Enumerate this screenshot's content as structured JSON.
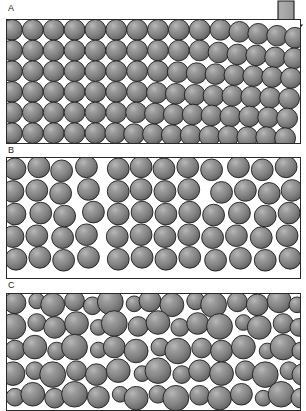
{
  "figure": {
    "background_color": "#ffffff",
    "width": 306,
    "height": 410,
    "sphere_fill": "#808080",
    "sphere_highlight": "#b4b4b4",
    "sphere_shadow": "#5a5a5a",
    "sphere_stroke": "#1c1c1c",
    "panel_border_color": "#2a2a2a",
    "void_color": "#ffffff"
  },
  "panels": [
    {
      "id": "a",
      "label": "A",
      "caption": "Ordered close packing with applied compaction",
      "packing_type": "ordered-cubic-to-hexagonal",
      "sphere_size": "monodisperse",
      "sphere_diameter_px": 21,
      "porosity_description": "regular interstitial voids",
      "has_compaction_arrow": true
    },
    {
      "id": "b",
      "label": "B",
      "caption": "Loose random packing with large voids",
      "packing_type": "loose-random",
      "sphere_size": "monodisperse",
      "sphere_diameter_px": 22,
      "porosity_description": "large irregular voids",
      "has_compaction_arrow": false
    },
    {
      "id": "c",
      "label": "C",
      "caption": "Dense polydisperse packing",
      "packing_type": "dense-polydisperse",
      "sphere_size": "polydisperse",
      "sphere_diameter_px": "8-24",
      "porosity_description": "minimal void space",
      "has_compaction_arrow": false
    }
  ],
  "arrow": {
    "name": "compaction-arrow",
    "direction": "down",
    "label": "",
    "fill": "#9a9a9a",
    "stroke": "#1c1c1c"
  },
  "chart_data": {
    "type": "scatter",
    "xlabel": "",
    "ylabel": "",
    "panel_a_spheres": [
      [
        11,
        29,
        10.5
      ],
      [
        32,
        29,
        10.5
      ],
      [
        53,
        29,
        10.5
      ],
      [
        74,
        29,
        10.5
      ],
      [
        95,
        29,
        10.5
      ],
      [
        116,
        29,
        10.5
      ],
      [
        137,
        29,
        10.5
      ],
      [
        158,
        29,
        10.5
      ],
      [
        179,
        29,
        10.5
      ],
      [
        200,
        29,
        10.5
      ],
      [
        221,
        29,
        10.5
      ],
      [
        240,
        31,
        10.5
      ],
      [
        259,
        33,
        10.5
      ],
      [
        278,
        35,
        10.5
      ],
      [
        296,
        37,
        10.5
      ],
      [
        11,
        50,
        10.5
      ],
      [
        32,
        50,
        10.5
      ],
      [
        53,
        50,
        10.5
      ],
      [
        74,
        50,
        10.5
      ],
      [
        95,
        50,
        10.5
      ],
      [
        116,
        50,
        10.5
      ],
      [
        137,
        50,
        10.5
      ],
      [
        158,
        50,
        10.5
      ],
      [
        179,
        50,
        10.5
      ],
      [
        200,
        50,
        10.5
      ],
      [
        219,
        52,
        10.5
      ],
      [
        238,
        54,
        10.5
      ],
      [
        257,
        55,
        10.5
      ],
      [
        276,
        57,
        10.5
      ],
      [
        295,
        58,
        10.5
      ],
      [
        11,
        71,
        10.5
      ],
      [
        32,
        71,
        10.5
      ],
      [
        53,
        71,
        10.5
      ],
      [
        74,
        71,
        10.5
      ],
      [
        95,
        71,
        10.5
      ],
      [
        116,
        71,
        10.5
      ],
      [
        137,
        71,
        10.5
      ],
      [
        158,
        71,
        10.5
      ],
      [
        178,
        72,
        10.5
      ],
      [
        197,
        73,
        10.5
      ],
      [
        216,
        74,
        10.5
      ],
      [
        235,
        75,
        10.5
      ],
      [
        254,
        76,
        10.5
      ],
      [
        273,
        77,
        10.5
      ],
      [
        292,
        78,
        10.5
      ],
      [
        11,
        92,
        10.5
      ],
      [
        32,
        92,
        10.5
      ],
      [
        53,
        92,
        10.5
      ],
      [
        74,
        92,
        10.5
      ],
      [
        95,
        92,
        10.5
      ],
      [
        116,
        92,
        10.5
      ],
      [
        137,
        92,
        10.5
      ],
      [
        157,
        93,
        10.5
      ],
      [
        176,
        94,
        10.5
      ],
      [
        195,
        95,
        10.5
      ],
      [
        214,
        96,
        10.5
      ],
      [
        233,
        96,
        10.5
      ],
      [
        252,
        97,
        10.5
      ],
      [
        271,
        98,
        10.5
      ],
      [
        290,
        99,
        10.5
      ],
      [
        11,
        113,
        10.5
      ],
      [
        32,
        113,
        10.5
      ],
      [
        53,
        113,
        10.5
      ],
      [
        74,
        113,
        10.5
      ],
      [
        95,
        113,
        10.5
      ],
      [
        116,
        113,
        10.5
      ],
      [
        136,
        113,
        10.5
      ],
      [
        155,
        114,
        10.5
      ],
      [
        174,
        115,
        10.5
      ],
      [
        193,
        115,
        10.5
      ],
      [
        212,
        116,
        10.5
      ],
      [
        231,
        117,
        10.5
      ],
      [
        250,
        117,
        10.5
      ],
      [
        269,
        118,
        10.5
      ],
      [
        288,
        119,
        10.5
      ],
      [
        11,
        134,
        10.5
      ],
      [
        32,
        134,
        10.5
      ],
      [
        53,
        134,
        10.5
      ],
      [
        74,
        134,
        10.5
      ],
      [
        95,
        134,
        10.5
      ],
      [
        115,
        134,
        10.5
      ],
      [
        134,
        135,
        10.5
      ],
      [
        153,
        135,
        10.5
      ],
      [
        172,
        136,
        10.5
      ],
      [
        191,
        136,
        10.5
      ],
      [
        210,
        137,
        10.5
      ],
      [
        229,
        137,
        10.5
      ],
      [
        248,
        138,
        10.5
      ],
      [
        267,
        138,
        10.5
      ],
      [
        286,
        139,
        10.5
      ]
    ],
    "panel_b_spheres": [
      [
        14,
        168,
        11
      ],
      [
        38,
        166,
        11
      ],
      [
        61,
        170,
        11
      ],
      [
        86,
        166,
        11
      ],
      [
        118,
        168,
        11
      ],
      [
        141,
        166,
        11
      ],
      [
        164,
        168,
        11
      ],
      [
        188,
        166,
        11
      ],
      [
        212,
        169,
        11
      ],
      [
        239,
        166,
        11
      ],
      [
        263,
        169,
        11
      ],
      [
        287,
        166,
        11
      ],
      [
        12,
        191,
        11
      ],
      [
        36,
        190,
        11
      ],
      [
        60,
        193,
        11
      ],
      [
        88,
        189,
        11
      ],
      [
        118,
        191,
        11
      ],
      [
        141,
        189,
        11
      ],
      [
        165,
        191,
        11
      ],
      [
        189,
        189,
        11
      ],
      [
        222,
        192,
        11
      ],
      [
        246,
        190,
        11
      ],
      [
        270,
        193,
        11
      ],
      [
        293,
        190,
        11
      ],
      [
        14,
        214,
        11
      ],
      [
        40,
        213,
        11
      ],
      [
        64,
        216,
        11
      ],
      [
        93,
        212,
        11
      ],
      [
        118,
        214,
        11
      ],
      [
        142,
        212,
        11
      ],
      [
        166,
        214,
        11
      ],
      [
        190,
        212,
        11
      ],
      [
        214,
        215,
        11
      ],
      [
        240,
        213,
        11
      ],
      [
        266,
        216,
        11
      ],
      [
        290,
        213,
        11
      ],
      [
        12,
        237,
        11
      ],
      [
        36,
        236,
        11
      ],
      [
        62,
        238,
        11
      ],
      [
        86,
        235,
        11
      ],
      [
        117,
        237,
        11
      ],
      [
        141,
        235,
        11
      ],
      [
        165,
        237,
        11
      ],
      [
        189,
        235,
        11
      ],
      [
        213,
        238,
        11
      ],
      [
        237,
        236,
        11
      ],
      [
        262,
        238,
        11
      ],
      [
        288,
        236,
        11
      ],
      [
        15,
        260,
        11
      ],
      [
        39,
        258,
        11
      ],
      [
        63,
        261,
        11
      ],
      [
        88,
        258,
        11
      ],
      [
        118,
        260,
        11
      ],
      [
        142,
        258,
        11
      ],
      [
        166,
        260,
        11
      ],
      [
        190,
        258,
        11
      ],
      [
        216,
        261,
        11
      ],
      [
        241,
        259,
        11
      ],
      [
        266,
        261,
        11
      ],
      [
        291,
        259,
        11
      ]
    ],
    "panel_c_spheres": [
      [
        14,
        302,
        11
      ],
      [
        36,
        300,
        8
      ],
      [
        52,
        304,
        12
      ],
      [
        74,
        300,
        10
      ],
      [
        92,
        305,
        9
      ],
      [
        110,
        301,
        13
      ],
      [
        134,
        303,
        8
      ],
      [
        150,
        300,
        11
      ],
      [
        172,
        304,
        12
      ],
      [
        196,
        300,
        9
      ],
      [
        214,
        304,
        13
      ],
      [
        238,
        301,
        10
      ],
      [
        258,
        304,
        11
      ],
      [
        280,
        300,
        12
      ],
      [
        298,
        304,
        8
      ],
      [
        12,
        326,
        13
      ],
      [
        36,
        322,
        9
      ],
      [
        54,
        327,
        11
      ],
      [
        76,
        323,
        12
      ],
      [
        98,
        327,
        8
      ],
      [
        114,
        323,
        13
      ],
      [
        138,
        326,
        10
      ],
      [
        158,
        322,
        12
      ],
      [
        180,
        327,
        9
      ],
      [
        198,
        323,
        11
      ],
      [
        220,
        326,
        13
      ],
      [
        244,
        322,
        8
      ],
      [
        260,
        327,
        12
      ],
      [
        284,
        323,
        10
      ],
      [
        300,
        327,
        9
      ],
      [
        14,
        350,
        10
      ],
      [
        34,
        347,
        12
      ],
      [
        56,
        351,
        9
      ],
      [
        74,
        347,
        13
      ],
      [
        98,
        350,
        8
      ],
      [
        114,
        347,
        11
      ],
      [
        136,
        351,
        12
      ],
      [
        160,
        347,
        9
      ],
      [
        178,
        351,
        13
      ],
      [
        202,
        348,
        10
      ],
      [
        222,
        351,
        11
      ],
      [
        244,
        347,
        12
      ],
      [
        268,
        351,
        8
      ],
      [
        284,
        347,
        13
      ],
      [
        302,
        351,
        9
      ],
      [
        12,
        374,
        12
      ],
      [
        34,
        371,
        9
      ],
      [
        52,
        375,
        13
      ],
      [
        76,
        371,
        10
      ],
      [
        96,
        375,
        11
      ],
      [
        118,
        371,
        12
      ],
      [
        142,
        374,
        8
      ],
      [
        158,
        371,
        13
      ],
      [
        182,
        375,
        9
      ],
      [
        200,
        371,
        11
      ],
      [
        222,
        374,
        12
      ],
      [
        246,
        371,
        10
      ],
      [
        266,
        375,
        13
      ],
      [
        290,
        371,
        9
      ],
      [
        304,
        375,
        11
      ],
      [
        14,
        398,
        9
      ],
      [
        32,
        395,
        12
      ],
      [
        54,
        399,
        10
      ],
      [
        74,
        395,
        13
      ],
      [
        98,
        398,
        11
      ],
      [
        120,
        395,
        8
      ],
      [
        136,
        399,
        12
      ],
      [
        158,
        395,
        9
      ],
      [
        176,
        399,
        13
      ],
      [
        200,
        396,
        10
      ],
      [
        220,
        399,
        12
      ],
      [
        242,
        395,
        11
      ],
      [
        264,
        399,
        8
      ],
      [
        282,
        395,
        13
      ],
      [
        302,
        399,
        10
      ]
    ]
  }
}
